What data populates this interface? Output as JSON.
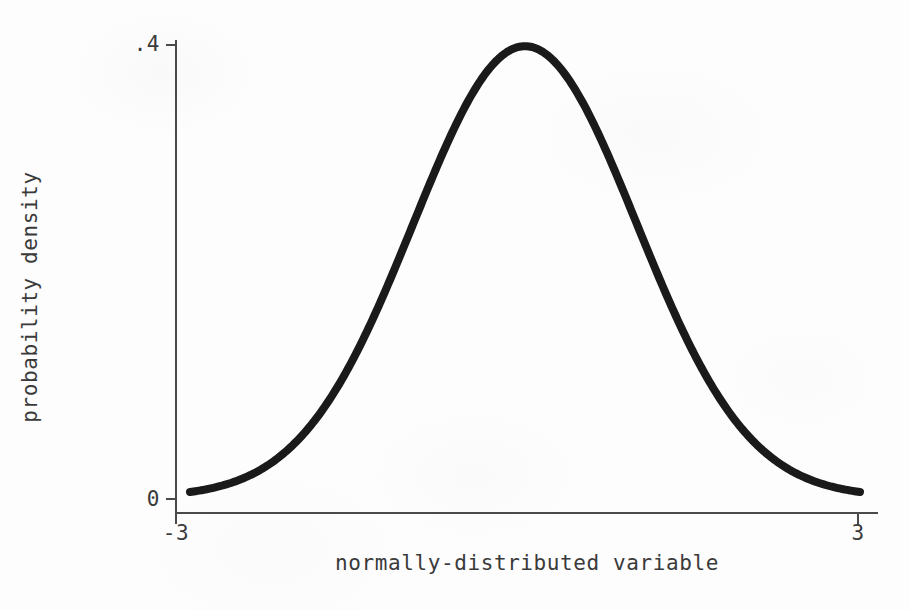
{
  "chart_data": {
    "type": "line",
    "title": "",
    "subtitle": "",
    "xlabel": "normally-distributed variable",
    "ylabel": "probability density",
    "xlim": [
      -3,
      3
    ],
    "ylim": [
      0,
      0.4
    ],
    "xticks": [
      -3,
      3
    ],
    "xticklabels": [
      "-3",
      "3"
    ],
    "yticks": [
      0,
      0.4
    ],
    "yticklabels": [
      "0",
      ".4"
    ],
    "grid": false,
    "legend": false,
    "legend_position": "none",
    "annotations": [],
    "series": [
      {
        "name": "standard normal density",
        "formula": "(1/sqrt(2*pi))*exp(-x^2/2)",
        "color": "#1a1a1a",
        "linewidth": 8,
        "x": [
          -3.0,
          -2.8,
          -2.6,
          -2.4,
          -2.2,
          -2.0,
          -1.8,
          -1.6,
          -1.4,
          -1.2,
          -1.0,
          -0.8,
          -0.6,
          -0.4,
          -0.2,
          0.0,
          0.2,
          0.4,
          0.6,
          0.8,
          1.0,
          1.2,
          1.4,
          1.6,
          1.8,
          2.0,
          2.2,
          2.4,
          2.6,
          2.8,
          3.0
        ],
        "values": [
          0.0044,
          0.0079,
          0.0136,
          0.0224,
          0.0355,
          0.054,
          0.079,
          0.1109,
          0.1497,
          0.1942,
          0.242,
          0.2897,
          0.3332,
          0.3683,
          0.391,
          0.3989,
          0.391,
          0.3683,
          0.3332,
          0.2897,
          0.242,
          0.1942,
          0.1497,
          0.1109,
          0.079,
          0.054,
          0.0355,
          0.0224,
          0.0136,
          0.0079,
          0.0044
        ]
      }
    ]
  },
  "axes": {
    "x_title": "normally-distributed variable",
    "y_title": "probability density",
    "x_tick_min": "-3",
    "x_tick_max": "3",
    "y_tick_min": "0",
    "y_tick_max": ".4"
  },
  "colors": {
    "curve": "#1a1a1a",
    "axis": "#4a4a4a",
    "text": "#3a3a3a",
    "background": "#fdfdfd"
  }
}
